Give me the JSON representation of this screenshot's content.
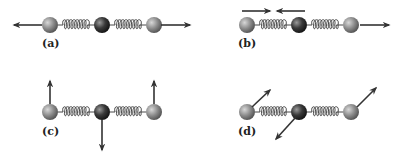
{
  "figure": {
    "colors": {
      "outer_atom": "#8a8a8a",
      "center_atom": "#3a3a3a",
      "arrow": "#333333",
      "spring": "#333333"
    },
    "panels": [
      {
        "id": "a",
        "label": "(a)",
        "mode": "symmetric stretch",
        "arrows": [
          {
            "atom": "left",
            "direction": "left"
          },
          {
            "atom": "right",
            "direction": "right"
          }
        ]
      },
      {
        "id": "b",
        "label": "(b)",
        "mode": "antisymmetric stretch",
        "arrows": [
          {
            "atom": "left",
            "direction": "right",
            "placement": "above"
          },
          {
            "atom": "center",
            "direction": "left",
            "placement": "above"
          },
          {
            "atom": "right",
            "direction": "right"
          }
        ]
      },
      {
        "id": "c",
        "label": "(c)",
        "mode": "bending (in-plane)",
        "arrows": [
          {
            "atom": "left",
            "direction": "up"
          },
          {
            "atom": "center",
            "direction": "down"
          },
          {
            "atom": "right",
            "direction": "up"
          }
        ]
      },
      {
        "id": "d",
        "label": "(d)",
        "mode": "bending (out-of-plane)",
        "arrows": [
          {
            "atom": "left",
            "direction": "up-right"
          },
          {
            "atom": "center",
            "direction": "down-left"
          },
          {
            "atom": "right",
            "direction": "up-right"
          }
        ]
      }
    ]
  }
}
